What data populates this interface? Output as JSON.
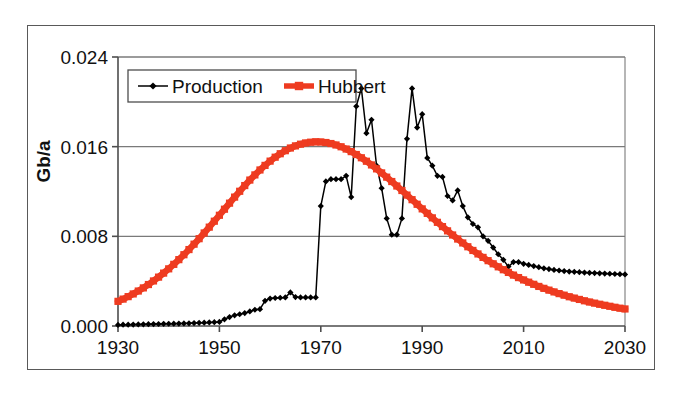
{
  "chart_data": {
    "type": "line",
    "title": "",
    "xlabel": "",
    "ylabel": "Gb/a",
    "xlim": [
      1930,
      2030
    ],
    "ylim": [
      0.0,
      0.024
    ],
    "grid": "horizontal",
    "legend_position": "top-left-inside",
    "x_ticks": [
      "1930",
      "1950",
      "1970",
      "1990",
      "2010",
      "2030"
    ],
    "x_tick_values": [
      1930,
      1950,
      1970,
      1990,
      2010,
      2030
    ],
    "y_ticks": [
      "0.000",
      "0.008",
      "0.016",
      "0.024"
    ],
    "y_tick_values": [
      0.0,
      0.008,
      0.016,
      0.024
    ],
    "x": [
      1930,
      1931,
      1932,
      1933,
      1934,
      1935,
      1936,
      1937,
      1938,
      1939,
      1940,
      1941,
      1942,
      1943,
      1944,
      1945,
      1946,
      1947,
      1948,
      1949,
      1950,
      1951,
      1952,
      1953,
      1954,
      1955,
      1956,
      1957,
      1958,
      1959,
      1960,
      1961,
      1962,
      1963,
      1964,
      1965,
      1966,
      1967,
      1968,
      1969,
      1970,
      1971,
      1972,
      1973,
      1974,
      1975,
      1976,
      1977,
      1978,
      1979,
      1980,
      1981,
      1982,
      1983,
      1984,
      1985,
      1986,
      1987,
      1988,
      1989,
      1990,
      1991,
      1992,
      1993,
      1994,
      1995,
      1996,
      1997,
      1998,
      1999,
      2000,
      2001,
      2002,
      2003,
      2004,
      2005,
      2006,
      2007,
      2008,
      2009,
      2010,
      2011,
      2012,
      2013,
      2014,
      2015,
      2016,
      2017,
      2018,
      2019,
      2020,
      2021,
      2022,
      2023,
      2024,
      2025,
      2026,
      2027,
      2028,
      2029,
      2030
    ],
    "series": [
      {
        "name": "Production",
        "color": "#000000",
        "marker": "diamond",
        "values": [
          0.0001,
          0.00012,
          0.00012,
          0.00013,
          0.00014,
          0.00015,
          0.00016,
          0.00017,
          0.00018,
          0.00019,
          0.0002,
          0.00021,
          0.00022,
          0.00023,
          0.00024,
          0.00026,
          0.00028,
          0.0003,
          0.00032,
          0.00034,
          0.00036,
          0.0006,
          0.0008,
          0.00095,
          0.00105,
          0.00115,
          0.0013,
          0.00145,
          0.0015,
          0.00225,
          0.00245,
          0.0025,
          0.00252,
          0.00255,
          0.003,
          0.00258,
          0.00255,
          0.00255,
          0.00255,
          0.00255,
          0.0107,
          0.0129,
          0.0131,
          0.0131,
          0.0131,
          0.0134,
          0.0115,
          0.0196,
          0.0212,
          0.0172,
          0.0184,
          0.0143,
          0.0123,
          0.0096,
          0.00815,
          0.00815,
          0.0096,
          0.0167,
          0.0212,
          0.0177,
          0.0189,
          0.015,
          0.0143,
          0.0134,
          0.0133,
          0.0116,
          0.0112,
          0.0121,
          0.0107,
          0.0097,
          0.0091,
          0.0088,
          0.008,
          0.0076,
          0.007,
          0.0064,
          0.0059,
          0.0053,
          0.0057,
          0.0057,
          0.00555,
          0.00545,
          0.00535,
          0.00525,
          0.00515,
          0.00508,
          0.005,
          0.00495,
          0.0049,
          0.00486,
          0.00483,
          0.0048,
          0.00477,
          0.00474,
          0.00472,
          0.0047,
          0.00468,
          0.00466,
          0.00464,
          0.00462,
          0.0046
        ]
      },
      {
        "name": "Hubbert",
        "color": "#EE3B20",
        "marker": "square",
        "values": [
          0.0022,
          0.0024,
          0.00262,
          0.00286,
          0.00312,
          0.0034,
          0.0037,
          0.00402,
          0.00436,
          0.00472,
          0.0051,
          0.0055,
          0.00592,
          0.00636,
          0.00682,
          0.0073,
          0.00779,
          0.0083,
          0.00882,
          0.00935,
          0.00988,
          0.01042,
          0.01096,
          0.0115,
          0.01202,
          0.01253,
          0.01302,
          0.01348,
          0.01392,
          0.01433,
          0.01471,
          0.01506,
          0.01537,
          0.01564,
          0.01588,
          0.01607,
          0.01622,
          0.01633,
          0.0164,
          0.01643,
          0.01642,
          0.01637,
          0.01628,
          0.01615,
          0.01599,
          0.01579,
          0.01556,
          0.0153,
          0.01501,
          0.0147,
          0.01437,
          0.01402,
          0.01366,
          0.01328,
          0.01289,
          0.01249,
          0.01209,
          0.01168,
          0.01127,
          0.01086,
          0.01045,
          0.01005,
          0.00965,
          0.00925,
          0.00887,
          0.00849,
          0.00812,
          0.00776,
          0.00741,
          0.00707,
          0.00674,
          0.00643,
          0.00612,
          0.00583,
          0.00555,
          0.00528,
          0.00502,
          0.00478,
          0.00454,
          0.00432,
          0.00411,
          0.00391,
          0.00372,
          0.00353,
          0.00336,
          0.0032,
          0.00304,
          0.00289,
          0.00275,
          0.00261,
          0.00249,
          0.00237,
          0.00225,
          0.00214,
          0.00204,
          0.00194,
          0.00185,
          0.00176,
          0.00167,
          0.00159,
          0.00152
        ]
      }
    ],
    "legend": [
      {
        "label": "Production",
        "color": "#000000",
        "marker": "diamond"
      },
      {
        "label": "Hubbert",
        "color": "#EE3B20",
        "marker": "square"
      }
    ]
  },
  "axis": {
    "y_label": "Gb/a"
  },
  "colors": {
    "production": "#000000",
    "hubbert": "#EE3B20",
    "axis": "#4d4d4d",
    "grid": "#7a7a7a",
    "frame": "#595959"
  }
}
